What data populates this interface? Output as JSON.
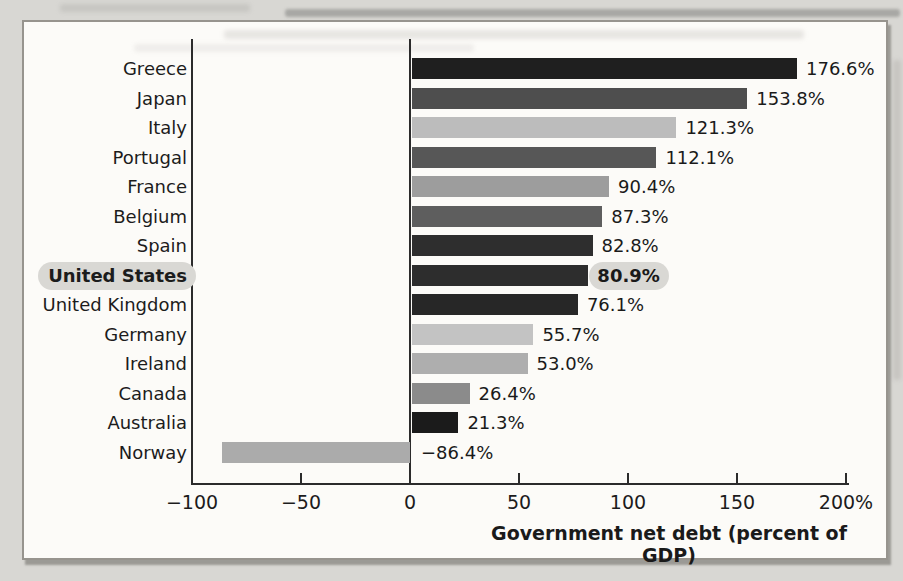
{
  "page": {
    "background_color": "#d8d7d3",
    "panel_background_color": "#fcfbf8",
    "panel_border_color": "#97948e"
  },
  "chart_data": {
    "type": "bar",
    "orientation": "horizontal",
    "xlabel": "Government net debt (percent of GDP)",
    "xlim": [
      -100,
      200
    ],
    "grid": false,
    "legend_position": "none",
    "categories": [
      "Greece",
      "Japan",
      "Italy",
      "Portugal",
      "France",
      "Belgium",
      "Spain",
      "United States",
      "United Kingdom",
      "Germany",
      "Ireland",
      "Canada",
      "Australia",
      "Norway"
    ],
    "values": [
      176.6,
      153.8,
      121.3,
      112.1,
      90.4,
      87.3,
      82.8,
      80.9,
      76.1,
      55.7,
      53.0,
      26.4,
      21.3,
      -86.4
    ],
    "value_labels": [
      "176.6%",
      "153.8%",
      "121.3%",
      "112.1%",
      "90.4%",
      "87.3%",
      "82.8%",
      "80.9%",
      "76.1%",
      "55.7%",
      "53.0%",
      "26.4%",
      "21.3%",
      "−86.4%"
    ],
    "bar_colors": [
      "#1f1f1f",
      "#4e4e4e",
      "#bcbcbc",
      "#575757",
      "#9d9d9d",
      "#5e5e5e",
      "#2e2e2e",
      "#2d2d2d",
      "#272727",
      "#c3c3c3",
      "#aeaeae",
      "#8b8b8b",
      "#1b1b1b",
      "#ababab"
    ],
    "highlighted_category": "United States",
    "highlight_pill_color": "#d9d8d4",
    "axis_color": "#2b2b2b",
    "xticks": [
      {
        "value": -100,
        "label": "−100"
      },
      {
        "value": -50,
        "label": "−50"
      },
      {
        "value": 0,
        "label": "0"
      },
      {
        "value": 50,
        "label": "50"
      },
      {
        "value": 100,
        "label": "100"
      },
      {
        "value": 150,
        "label": "150"
      },
      {
        "value": 200,
        "label": "200%"
      }
    ]
  }
}
